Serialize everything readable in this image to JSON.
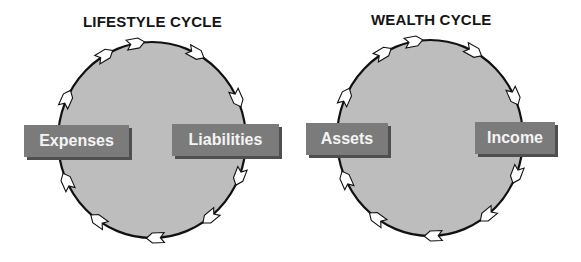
{
  "cycles": [
    {
      "title": "LIFESTYLE CYCLE",
      "left_label": "Expenses",
      "right_label": "Liabilities",
      "direction": "clockwise",
      "arrow_count": 10
    },
    {
      "title": "WEALTH CYCLE",
      "left_label": "Assets",
      "right_label": "Income",
      "direction": "clockwise",
      "arrow_count": 10
    }
  ],
  "colors": {
    "circle_fill": "#bdbdbd",
    "circle_stroke": "#111111",
    "box_fill": "#7b7b7b",
    "box_shadow": "#4f4f4f",
    "box_text": "#f4f4f4",
    "arrow_fill": "#ffffff"
  }
}
